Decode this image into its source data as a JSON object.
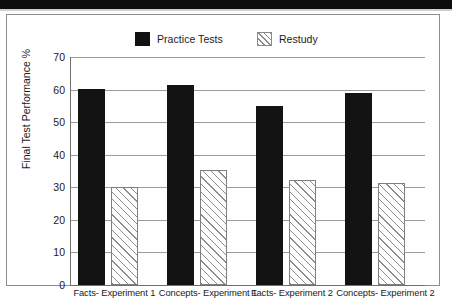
{
  "figure": {
    "legend": {
      "items": [
        {
          "label": "Practice Tests",
          "swatch": "solid-black-swatch",
          "color": "#131313"
        },
        {
          "label": "Restudy",
          "swatch": "hatched-swatch",
          "color": "#8c8c8c"
        }
      ]
    },
    "y_axis_title": "Final Test Performance %"
  },
  "chart_data": {
    "type": "bar",
    "title": "",
    "xlabel": "",
    "ylabel": "Final Test Performance %",
    "ylim": [
      0,
      70
    ],
    "yticks": [
      0,
      10,
      20,
      30,
      40,
      50,
      60,
      70
    ],
    "ytick_labels": [
      "0",
      "10",
      "20",
      "30",
      "40",
      "50",
      "60",
      "70"
    ],
    "grid": true,
    "legend_position": "top-center",
    "categories": [
      "Facts- Experiment 1",
      "Concepts- Experiment 1",
      "Facts- Experiment 2",
      "Concepts- Experiment 2"
    ],
    "series": [
      {
        "name": "Practice Tests",
        "values": [
          60.3,
          61.5,
          55.0,
          59.0
        ],
        "color": "#131313"
      },
      {
        "name": "Restudy",
        "values": [
          30.0,
          35.2,
          32.3,
          31.2
        ],
        "color": "#8c8c8c"
      }
    ]
  }
}
